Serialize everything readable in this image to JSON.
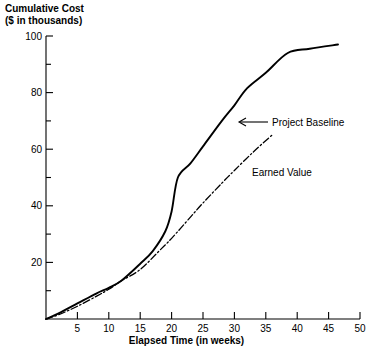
{
  "chart_data": {
    "type": "line",
    "title_line1": "Cumulative Cost",
    "title_line2": "($ in thousands)",
    "xlabel": "Elapsed Time (in weeks)",
    "ylabel": "Cumulative Cost ($ in thousands)",
    "xlim": [
      0,
      50
    ],
    "ylim": [
      0,
      100
    ],
    "grid": false,
    "legend_position": "inline-annotations",
    "x_ticks": [
      0,
      5,
      10,
      15,
      20,
      25,
      30,
      35,
      40,
      45,
      50
    ],
    "x_tick_labels": [
      "",
      "5",
      "10",
      "15",
      "20",
      "25",
      "30",
      "35",
      "40",
      "45",
      "50"
    ],
    "y_ticks": [
      0,
      10,
      20,
      30,
      40,
      50,
      60,
      70,
      80,
      90,
      100
    ],
    "y_tick_labels": [
      "",
      "",
      "20",
      "",
      "40",
      "",
      "60",
      "",
      "80",
      "",
      "100"
    ],
    "y_minor_ticks": [
      10,
      30,
      50,
      70,
      90
    ],
    "series": [
      {
        "name": "Project Baseline",
        "style": "solid",
        "color": "#000000",
        "x": [
          0,
          2,
          5,
          8,
          10,
          12,
          15,
          17,
          19,
          20,
          21,
          23,
          25,
          28,
          30,
          32,
          35,
          38.5,
          42,
          46.5
        ],
        "values": [
          0,
          2,
          5.5,
          9,
          11,
          13.5,
          19.5,
          24,
          31,
          38,
          50,
          55,
          61,
          70,
          75.5,
          81.5,
          87,
          94,
          95.5,
          97
        ]
      },
      {
        "name": "Earned Value",
        "style": "dash-dot",
        "color": "#000000",
        "x": [
          0,
          2,
          5,
          8,
          10,
          12,
          15,
          18,
          20,
          23,
          25,
          28,
          30,
          33,
          36
        ],
        "values": [
          0,
          1.5,
          4.5,
          8,
          10.5,
          13.5,
          17.5,
          24,
          28.5,
          36,
          41,
          48,
          52.5,
          59,
          65
        ]
      }
    ],
    "annotations": [
      {
        "text": "Project Baseline",
        "type": "arrow-label",
        "arrow_direction": "left",
        "points_to_series": "Project Baseline"
      },
      {
        "text": "Earned Value",
        "type": "label",
        "points_to_series": "Earned Value"
      }
    ]
  }
}
